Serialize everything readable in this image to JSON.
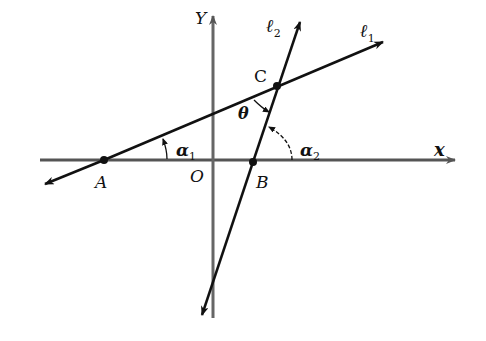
{
  "diagram": {
    "axes": {
      "x_label": "x",
      "y_label": "Y",
      "origin_label": "O"
    },
    "lines": [
      {
        "name": "l1",
        "label": "ℓ",
        "sub": "1"
      },
      {
        "name": "l2",
        "label": "ℓ",
        "sub": "2"
      }
    ],
    "points": {
      "A": "A",
      "B": "B",
      "C": "C"
    },
    "angles": {
      "alpha1": {
        "symbol": "α",
        "sub": "1"
      },
      "alpha2": {
        "symbol": "α",
        "sub": "2"
      },
      "theta": {
        "symbol": "θ"
      }
    },
    "colors": {
      "stroke": "#111111",
      "axis": "#555555",
      "background": "#ffffff"
    }
  }
}
